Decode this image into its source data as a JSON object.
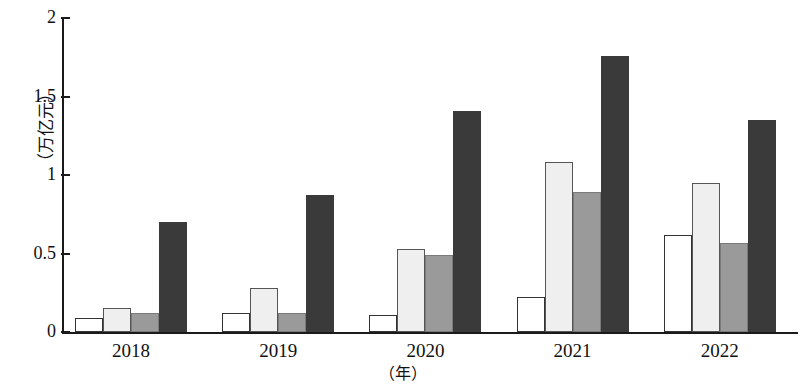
{
  "chart_data": {
    "type": "bar",
    "title": "",
    "subtitle": "",
    "xlabel": "（年）",
    "ylabel": "（万亿元）",
    "categories": [
      "2018",
      "2019",
      "2020",
      "2021",
      "2022"
    ],
    "ylim": [
      0,
      2
    ],
    "ytick_labels": [
      "2",
      "1.5",
      "1",
      "0.5",
      "0"
    ],
    "ytick_values": [
      2,
      1.5,
      1,
      0.5,
      0
    ],
    "grid": false,
    "legend": "none",
    "series": [
      {
        "name": "series-1",
        "color": "#ffffff",
        "values": [
          0.09,
          0.12,
          0.11,
          0.22,
          0.62
        ]
      },
      {
        "name": "series-2",
        "color": "#efefef",
        "values": [
          0.15,
          0.28,
          0.53,
          1.08,
          0.95
        ]
      },
      {
        "name": "series-3",
        "color": "#9a9a9a",
        "values": [
          0.12,
          0.12,
          0.49,
          0.89,
          0.57
        ]
      },
      {
        "name": "series-4",
        "color": "#3a3a3a",
        "values": [
          0.7,
          0.87,
          1.41,
          1.76,
          1.35
        ]
      }
    ]
  }
}
